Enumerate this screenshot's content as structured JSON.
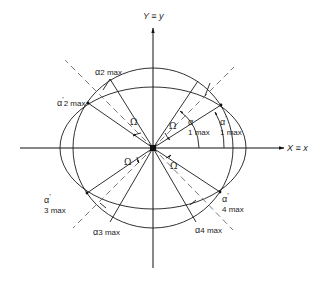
{
  "diagram": {
    "axes": {
      "x_label": "X ≡ x",
      "y_label": "Y ≡ y"
    },
    "labels": {
      "a2max": {
        "greek": "α",
        "sub": "2 max"
      },
      "a2max_prime": {
        "greek": "α",
        "prime": "'",
        "sub": "2 max"
      },
      "a1max": {
        "greek": "α",
        "sub": "1 max"
      },
      "a1max_prime": {
        "greek": "α",
        "prime": "'",
        "sub": "1 max"
      },
      "a3max": {
        "greek": "α",
        "sub": "3 max"
      },
      "a3max_prime": {
        "greek": "α",
        "prime": "'",
        "sub": "3 max"
      },
      "a4max": {
        "greek": "α",
        "sub": "4 max"
      },
      "a4max_prime": {
        "greek": "α",
        "prime": "'",
        "sub": "4 max"
      },
      "omega": "Ω"
    },
    "colors": {
      "line": "#1a1a1a",
      "background": "#ffffff"
    }
  }
}
